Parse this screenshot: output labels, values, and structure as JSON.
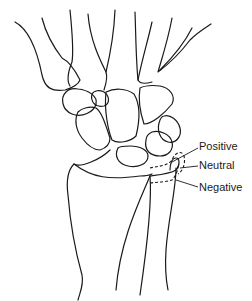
{
  "figure": {
    "line_color": "#1a1a1a",
    "background": "#ffffff"
  },
  "labels": {
    "positive": "Positive",
    "neutral": "Neutral",
    "negative": "Negative"
  }
}
